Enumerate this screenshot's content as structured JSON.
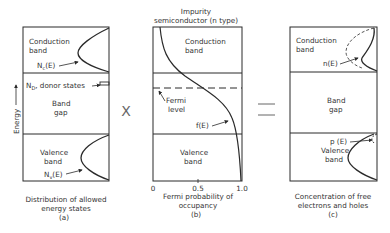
{
  "panel_a": {
    "conduction_label_1": "Conduction",
    "conduction_label_2": "band",
    "nc_label": "Nₑ(E)",
    "nc_main": "N",
    "nc_sub": "c",
    "nc_tail": "(E)",
    "donor_label": "N D, donor states",
    "donor_main": "N",
    "donor_sub": "D",
    "donor_tail": ", donor states",
    "gap_label_1": "Band",
    "gap_label_2": "gap",
    "valence_label_1": "Valence",
    "valence_label_2": "band",
    "nv_main": "N",
    "nv_sub": "v",
    "nv_tail": "(E)",
    "axis_label": "Energy",
    "caption_1": "Distribution of allowed",
    "caption_2": "energy states",
    "caption_3": "(a)"
  },
  "operator_1": "X",
  "panel_b": {
    "title_1": "Impurity",
    "title_2": "semiconductor (n type)",
    "conduction_label_1": "Conduction",
    "conduction_label_2": "band",
    "fermi_label_1": "Fermi",
    "fermi_label_2": "level",
    "fe_label": "f(E)",
    "valence_label_1": "Valence",
    "valence_label_2": "band",
    "ticks": [
      "0",
      "0.5",
      "1.0"
    ],
    "caption_1": "Fermi probability of",
    "caption_2": "occupancy",
    "caption_3": "(b)"
  },
  "operator_2": "=",
  "panel_c": {
    "conduction_label_1": "Conduction",
    "conduction_label_2": "band",
    "ne_label": "n(E)",
    "gap_label_1": "Band",
    "gap_label_2": "gap",
    "pe_label": "p (E)",
    "valence_label_1": "Valence",
    "valence_label_2": "band",
    "caption_1": "Concentration of free",
    "caption_2": "electrons and holes",
    "caption_3": "(c)"
  },
  "colors": {
    "line": "#2a2a2a",
    "text": "#333333",
    "background": "#ffffff"
  }
}
